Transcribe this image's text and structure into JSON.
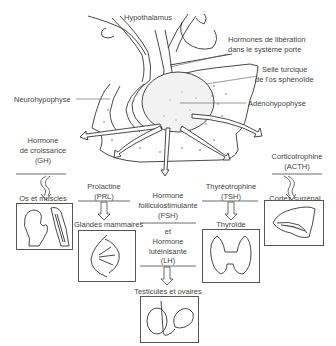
{
  "diagram": {
    "type": "anatomical-flow",
    "labels": {
      "hypothalamus": "Hypothalamus",
      "releasing_hormones_1": "Hormones de libération",
      "releasing_hormones_2": "dans le système porte",
      "sella_1": "Selle turcique",
      "sella_2": "de l'os sphénoïde",
      "neurohypophysis": "Neurohypophyse",
      "adenohypophysis": "Adénohypophyse"
    },
    "hormones": [
      {
        "id": "gh",
        "line1": "Hormone",
        "line2": "de croissance",
        "line3": "(GH)",
        "target": "Os et muscles"
      },
      {
        "id": "prl",
        "line1": "Prolactine",
        "line2": "(PRL)",
        "target": "Glandes mammaires"
      },
      {
        "id": "fsh_lh",
        "line1": "Hormone",
        "line2": "folliculostimulante",
        "line3": "(FSH)",
        "line4": "et",
        "line5": "Hormone",
        "line6": "lutéinisante",
        "line7": "(LH)",
        "target": "Testicules et ovaires"
      },
      {
        "id": "tsh",
        "line1": "Thyréotrophine",
        "line2": "(TSH)",
        "target": "Thyroïde"
      },
      {
        "id": "acth",
        "line1": "Corticotrophine",
        "line2": "(ACTH)",
        "target": "Cortex surrénal"
      }
    ]
  }
}
